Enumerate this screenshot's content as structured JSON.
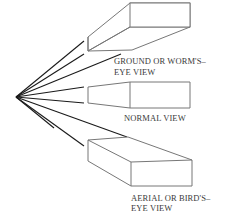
{
  "diagram": {
    "type": "perspective-views",
    "views": [
      {
        "id": "ground",
        "label_line1": "GROUND OR WORM'S–",
        "label_line2": "EYE VIEW"
      },
      {
        "id": "normal",
        "label_line1": "NORMAL VIEW"
      },
      {
        "id": "aerial",
        "label_line1": "AERIAL OR BIRD'S–",
        "label_line2": "EYE VIEW"
      }
    ],
    "colors": {
      "sight_lines": "#1a1a1a",
      "box_outline": "#777777",
      "label_text": "#3a3a3a",
      "background": "#ffffff"
    }
  }
}
